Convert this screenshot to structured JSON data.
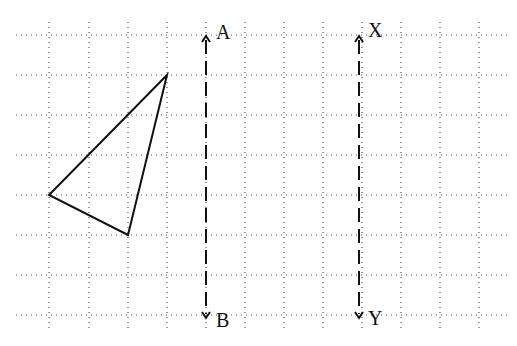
{
  "diagram": {
    "type": "grid-reflection",
    "grid": {
      "x_lines": [
        49,
        89,
        128,
        167,
        206,
        245,
        284,
        323,
        362,
        401,
        440,
        479
      ],
      "y_lines": [
        35,
        75,
        115,
        155,
        195,
        235,
        275,
        315
      ],
      "x_extent": [
        16,
        510
      ],
      "y_extent": [
        22,
        330
      ]
    },
    "triangle": {
      "vertices": [
        [
          167,
          75
        ],
        [
          49,
          195
        ],
        [
          128,
          235
        ]
      ]
    },
    "lines": [
      {
        "id": "AB",
        "x": 206,
        "y_top": 36,
        "y_bottom": 318,
        "top_label": "A",
        "bottom_label": "B"
      },
      {
        "id": "XY",
        "x": 359,
        "y_top": 36,
        "y_bottom": 318,
        "top_label": "X",
        "bottom_label": "Y"
      }
    ]
  },
  "labels": {
    "A": "A",
    "B": "B",
    "X": "X",
    "Y": "Y"
  }
}
